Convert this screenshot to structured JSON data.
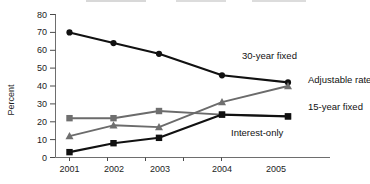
{
  "chart_data": {
    "type": "line",
    "title": "",
    "xlabel": "",
    "ylabel": "Percent",
    "categories": [
      "2001",
      "2002",
      "2003",
      "2004",
      "2005"
    ],
    "ylim": [
      0,
      80
    ],
    "yticks": [
      0,
      10,
      20,
      30,
      40,
      50,
      60,
      70,
      80
    ],
    "grid": false,
    "legend_position": "inline-right-labels",
    "series": [
      {
        "name": "30-year fixed",
        "marker": "circle",
        "color": "#111111",
        "values": [
          70,
          64,
          58,
          46,
          42
        ]
      },
      {
        "name": "Adjustable rate",
        "marker": "triangle",
        "color": "#6f6f6f",
        "values": [
          12,
          18,
          17,
          31,
          40
        ]
      },
      {
        "name": "15-year fixed",
        "marker": "square",
        "color": "#6f6f6f",
        "values": [
          22,
          22,
          26,
          24,
          23
        ]
      },
      {
        "name": "Interest-only",
        "marker": "square",
        "color": "#111111",
        "values": [
          3,
          8,
          11,
          24,
          23
        ]
      }
    ]
  },
  "axis": {
    "y_title": "Percent",
    "y_tick_labels": [
      "80",
      "70",
      "60",
      "50",
      "40",
      "30",
      "20",
      "10",
      "0"
    ],
    "x_tick_labels": [
      "2001",
      "2002",
      "2003",
      "2004",
      "2005"
    ]
  },
  "annotations": {
    "label_30_year_fixed": "30-year fixed",
    "label_adjustable_rate": "Adjustable rate",
    "label_15_year_fixed": "15-year fixed",
    "label_interest_only": "Interest-only"
  }
}
